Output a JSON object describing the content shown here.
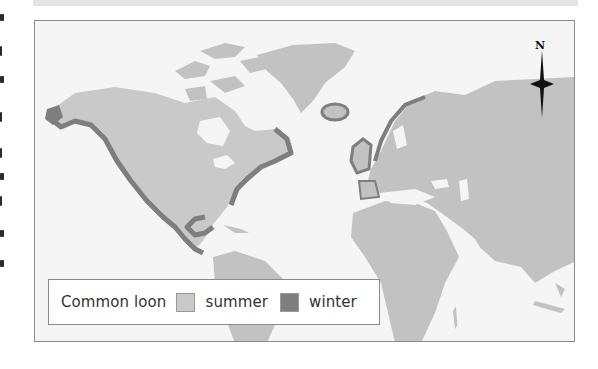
{
  "map": {
    "subject": "Common loon",
    "legend": {
      "title": "Common loon",
      "items": [
        {
          "label": "summer",
          "color": "#c9c9c9"
        },
        {
          "label": "winter",
          "color": "#7e7e7e"
        }
      ]
    },
    "compass": {
      "label": "N"
    },
    "colors": {
      "ocean": "#f5f5f5",
      "land": "#c2c2c2",
      "summer_range": "#c9c9c9",
      "winter_range": "#7e7e7e",
      "frame": "#8c8c8c"
    }
  }
}
